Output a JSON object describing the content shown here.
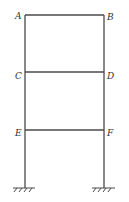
{
  "diagram": {
    "type": "structural-frame",
    "nodes": [
      {
        "id": "A",
        "label": "A",
        "x": 25,
        "y": 15
      },
      {
        "id": "B",
        "label": "B",
        "x": 104,
        "y": 15
      },
      {
        "id": "C",
        "label": "C",
        "x": 25,
        "y": 72
      },
      {
        "id": "D",
        "label": "D",
        "x": 104,
        "y": 72
      },
      {
        "id": "E",
        "label": "E",
        "x": 25,
        "y": 130
      },
      {
        "id": "F",
        "label": "F",
        "x": 104,
        "y": 130
      }
    ],
    "members": [
      {
        "from": "A",
        "to": "B",
        "kind": "beam"
      },
      {
        "from": "C",
        "to": "D",
        "kind": "beam"
      },
      {
        "from": "E",
        "to": "F",
        "kind": "beam"
      },
      {
        "from": "A",
        "to": "ground-left",
        "kind": "column"
      },
      {
        "from": "B",
        "to": "ground-right",
        "kind": "column"
      }
    ],
    "supports": [
      {
        "id": "ground-left",
        "type": "fixed",
        "x": 25,
        "y": 188
      },
      {
        "id": "ground-right",
        "type": "fixed",
        "x": 104,
        "y": 188
      }
    ],
    "colors": {
      "line": "#4a4a4a",
      "label": "#333333"
    }
  }
}
